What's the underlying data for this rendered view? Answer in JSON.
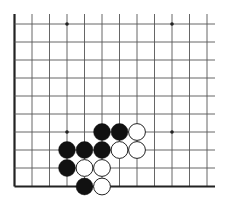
{
  "board": {
    "type": "go-board-corner-diagram",
    "view": "bottom-left corner",
    "colors": {
      "background": "#ffffff",
      "line": "#555555",
      "edge": "#222222",
      "black_stone": "#111111",
      "white_stone": "#ffffff",
      "white_stroke": "#222222"
    },
    "grid": {
      "x_lines": [
        14.5,
        32,
        49.5,
        67,
        84.5,
        102,
        119.5,
        137,
        154.5,
        172,
        189.5,
        207
      ],
      "y_lines": [
        24,
        42,
        60,
        78,
        96,
        114,
        132,
        150,
        168,
        186.5
      ],
      "left_edge_col": 0,
      "bottom_edge_row": 9,
      "x_right_extent": 215,
      "y_top_extent": 14
    },
    "star_points": [
      {
        "col": 3,
        "row": 0
      },
      {
        "col": 9,
        "row": 0
      },
      {
        "col": 3,
        "row": 6
      },
      {
        "col": 9,
        "row": 6
      }
    ],
    "stones": [
      {
        "color": "black",
        "col": 5,
        "row": 6
      },
      {
        "color": "black",
        "col": 6,
        "row": 6
      },
      {
        "color": "white",
        "col": 7,
        "row": 6
      },
      {
        "color": "black",
        "col": 3,
        "row": 7
      },
      {
        "color": "black",
        "col": 4,
        "row": 7
      },
      {
        "color": "black",
        "col": 5,
        "row": 7
      },
      {
        "color": "white",
        "col": 6,
        "row": 7
      },
      {
        "color": "white",
        "col": 7,
        "row": 7
      },
      {
        "color": "black",
        "col": 3,
        "row": 8
      },
      {
        "color": "white",
        "col": 4,
        "row": 8
      },
      {
        "color": "white",
        "col": 5,
        "row": 8
      },
      {
        "color": "black",
        "col": 4,
        "row": 9
      },
      {
        "color": "white",
        "col": 5,
        "row": 9
      }
    ]
  }
}
